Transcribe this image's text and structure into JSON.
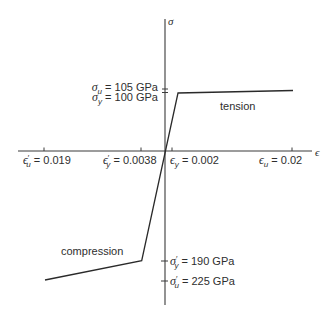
{
  "diagram": {
    "type": "stress-strain",
    "axes": {
      "y_label": "σ",
      "x_label": "ϵ"
    },
    "regions": {
      "tension": "tension",
      "compression": "compression"
    },
    "stress_labels": {
      "tension_ultimate": {
        "symbol": "σ",
        "sub": "u",
        "value": " = 105 GPa"
      },
      "tension_yield": {
        "symbol": "σ",
        "sub": "y",
        "value": " = 100 GPa"
      },
      "compression_yield": {
        "symbol": "σ",
        "prime": "′",
        "sub": "y",
        "value": " = 190 GPa"
      },
      "compression_ultimate": {
        "symbol": "σ",
        "prime": "′",
        "sub": "u",
        "value": " = 225 GPa"
      }
    },
    "strain_labels": {
      "compression_ultimate": {
        "symbol": "ϵ",
        "prime": "′",
        "sub": "u",
        "value": " = 0.019"
      },
      "compression_yield": {
        "symbol": "ϵ",
        "prime": "′",
        "sub": "y",
        "value": " = 0.0038"
      },
      "tension_yield": {
        "symbol": "ϵ",
        "sub": "y",
        "value": " = 0.002"
      },
      "tension_ultimate": {
        "symbol": "ϵ",
        "sub": "u",
        "value": " = 0.02"
      }
    },
    "curve_points": {
      "tension": [
        [
          0,
          0
        ],
        [
          0.002,
          100
        ],
        [
          0.02,
          105
        ]
      ],
      "compression": [
        [
          0,
          0
        ],
        [
          -0.0038,
          -190
        ],
        [
          -0.019,
          -225
        ]
      ]
    },
    "colors": {
      "line": "#2a2a2a",
      "text": "#2e2e2e",
      "background": "#ffffff"
    }
  }
}
